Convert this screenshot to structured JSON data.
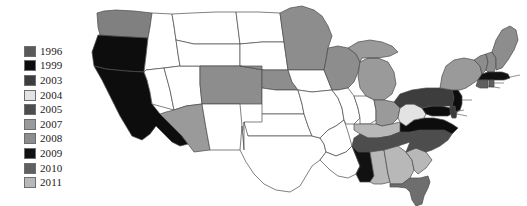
{
  "figure": {
    "type": "choropleth-map",
    "region": "United States",
    "background_color": "#ffffff"
  },
  "legend": {
    "position": "left",
    "items": [
      {
        "label": "1996",
        "color": "#5a5a5a"
      },
      {
        "label": "1999",
        "color": "#0d0d0d"
      },
      {
        "label": "2003",
        "color": "#3d3d3d"
      },
      {
        "label": "2004",
        "color": "#e3e3e3"
      },
      {
        "label": "2005",
        "color": "#4d4d4d"
      },
      {
        "label": "2007",
        "color": "#9a9a9a"
      },
      {
        "label": "2008",
        "color": "#8d8d8d"
      },
      {
        "label": "2009",
        "color": "#111111"
      },
      {
        "label": "2010",
        "color": "#606060"
      },
      {
        "label": "2011",
        "color": "#b8b8b8"
      }
    ]
  },
  "map_data": {
    "no_data_color": "#ffffff",
    "border_color": "#4a4a4a",
    "states": [
      {
        "code": "WA",
        "name": "Washington",
        "value": "1996",
        "color": "#808080"
      },
      {
        "code": "OR",
        "name": "Oregon",
        "value": "1999",
        "color": "#0d0d0d"
      },
      {
        "code": "CA",
        "name": "California",
        "value": "1999",
        "color": "#0d0d0d"
      },
      {
        "code": "ID",
        "name": "Idaho",
        "value": "",
        "color": "#ffffff"
      },
      {
        "code": "NV",
        "name": "Nevada",
        "value": "",
        "color": "#ffffff"
      },
      {
        "code": "UT",
        "name": "Utah",
        "value": "",
        "color": "#ffffff"
      },
      {
        "code": "AZ",
        "name": "Arizona",
        "value": "2007",
        "color": "#9a9a9a"
      },
      {
        "code": "MT",
        "name": "Montana",
        "value": "",
        "color": "#ffffff"
      },
      {
        "code": "WY",
        "name": "Wyoming",
        "value": "",
        "color": "#ffffff"
      },
      {
        "code": "CO",
        "name": "Colorado",
        "value": "2008",
        "color": "#8d8d8d"
      },
      {
        "code": "NM",
        "name": "New Mexico",
        "value": "",
        "color": "#ffffff"
      },
      {
        "code": "ND",
        "name": "North Dakota",
        "value": "",
        "color": "#ffffff"
      },
      {
        "code": "SD",
        "name": "South Dakota",
        "value": "",
        "color": "#ffffff"
      },
      {
        "code": "NE",
        "name": "Nebraska",
        "value": "2008",
        "color": "#8d8d8d"
      },
      {
        "code": "KS",
        "name": "Kansas",
        "value": "",
        "color": "#ffffff"
      },
      {
        "code": "OK",
        "name": "Oklahoma",
        "value": "",
        "color": "#ffffff"
      },
      {
        "code": "TX",
        "name": "Texas",
        "value": "",
        "color": "#ffffff"
      },
      {
        "code": "MN",
        "name": "Minnesota",
        "value": "2008",
        "color": "#8d8d8d"
      },
      {
        "code": "IA",
        "name": "Iowa",
        "value": "",
        "color": "#ffffff"
      },
      {
        "code": "MO",
        "name": "Missouri",
        "value": "",
        "color": "#ffffff"
      },
      {
        "code": "AR",
        "name": "Arkansas",
        "value": "",
        "color": "#ffffff"
      },
      {
        "code": "LA",
        "name": "Louisiana",
        "value": "",
        "color": "#ffffff"
      },
      {
        "code": "WI",
        "name": "Wisconsin",
        "value": "2008",
        "color": "#8d8d8d"
      },
      {
        "code": "IL",
        "name": "Illinois",
        "value": "",
        "color": "#ffffff"
      },
      {
        "code": "MI",
        "name": "Michigan",
        "value": "2007",
        "color": "#9a9a9a"
      },
      {
        "code": "IN",
        "name": "Indiana",
        "value": "",
        "color": "#ffffff"
      },
      {
        "code": "OH",
        "name": "Ohio",
        "value": "2007",
        "color": "#9a9a9a"
      },
      {
        "code": "KY",
        "name": "Kentucky",
        "value": "2011",
        "color": "#b8b8b8"
      },
      {
        "code": "TN",
        "name": "Tennessee",
        "value": "2005",
        "color": "#4d4d4d"
      },
      {
        "code": "MS",
        "name": "Mississippi",
        "value": "2009",
        "color": "#111111"
      },
      {
        "code": "AL",
        "name": "Alabama",
        "value": "2011",
        "color": "#b8b8b8"
      },
      {
        "code": "GA",
        "name": "Georgia",
        "value": "2011",
        "color": "#b8b8b8"
      },
      {
        "code": "FL",
        "name": "Florida",
        "value": "1996",
        "color": "#6e6e6e"
      },
      {
        "code": "SC",
        "name": "South Carolina",
        "value": "2011",
        "color": "#b8b8b8"
      },
      {
        "code": "NC",
        "name": "North Carolina",
        "value": "2005",
        "color": "#4d4d4d"
      },
      {
        "code": "VA",
        "name": "Virginia",
        "value": "1999",
        "color": "#0d0d0d"
      },
      {
        "code": "WV",
        "name": "West Virginia",
        "value": "2004",
        "color": "#e3e3e3"
      },
      {
        "code": "MD",
        "name": "Maryland",
        "value": "1999",
        "color": "#0d0d0d"
      },
      {
        "code": "DE",
        "name": "Delaware",
        "value": "2003",
        "color": "#3d3d3d"
      },
      {
        "code": "PA",
        "name": "Pennsylvania",
        "value": "2003",
        "color": "#3d3d3d"
      },
      {
        "code": "NJ",
        "name": "New Jersey",
        "value": "1999",
        "color": "#0d0d0d"
      },
      {
        "code": "NY",
        "name": "New York",
        "value": "2007",
        "color": "#9a9a9a"
      },
      {
        "code": "CT",
        "name": "Connecticut",
        "value": "2010",
        "color": "#606060"
      },
      {
        "code": "RI",
        "name": "Rhode Island",
        "value": "2010",
        "color": "#606060"
      },
      {
        "code": "MA",
        "name": "Massachusetts",
        "value": "2009",
        "color": "#111111"
      },
      {
        "code": "VT",
        "name": "Vermont",
        "value": "2008",
        "color": "#8d8d8d"
      },
      {
        "code": "NH",
        "name": "New Hampshire",
        "value": "2008",
        "color": "#8d8d8d"
      },
      {
        "code": "ME",
        "name": "Maine",
        "value": "2008",
        "color": "#8d8d8d"
      }
    ]
  }
}
